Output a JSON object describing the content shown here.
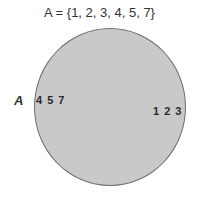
{
  "title": "A = {1, 2, 3, 4, 5, 7}",
  "set": {
    "label": "A",
    "fill_color": "#c9c9c9",
    "border_color": "#6e6e6e"
  },
  "elements": {
    "left_group": "4 5 7",
    "right_group": "1 2 3"
  }
}
